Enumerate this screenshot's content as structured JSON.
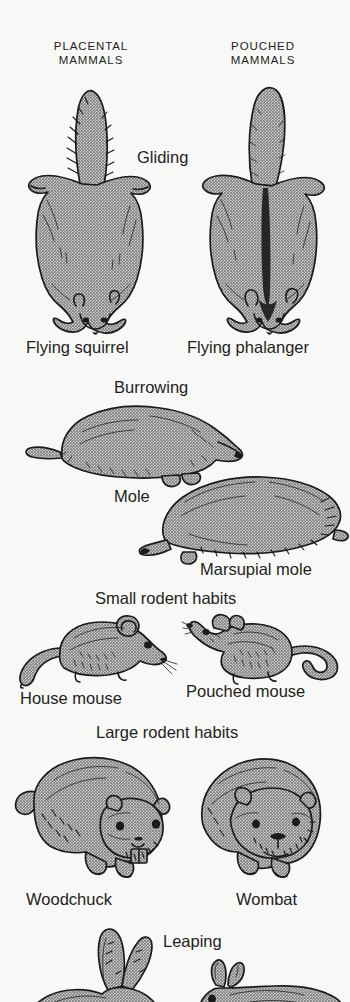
{
  "figure": {
    "title_visible": false,
    "background_color": "#f8f8f7",
    "fill_color": "#a8a8a8",
    "ink_color": "#1b1b1b",
    "columns": [
      {
        "id": "placental",
        "label_line1": "PLACENTAL",
        "label_line2": "MAMMALS"
      },
      {
        "id": "pouched",
        "label_line1": "POUCHED",
        "label_line2": "MAMMALS"
      }
    ],
    "habit_rows": [
      {
        "habit": "Gliding",
        "placental_species": "Flying squirrel",
        "pouched_species": "Flying phalanger"
      },
      {
        "habit": "Burrowing",
        "placental_species": "Mole",
        "pouched_species": "Marsupial mole"
      },
      {
        "habit": "Small rodent habits",
        "placental_species": "House mouse",
        "pouched_species": "Pouched mouse"
      },
      {
        "habit": "Large rodent habits",
        "placental_species": "Woodchuck",
        "pouched_species": "Wombat"
      },
      {
        "habit": "Leaping",
        "placental_species": "",
        "pouched_species": ""
      }
    ]
  },
  "labels": {
    "col_placental_1": "PLACENTAL",
    "col_placental_2": "MAMMALS",
    "col_pouched_1": "POUCHED",
    "col_pouched_2": "MAMMALS",
    "gliding": "Gliding",
    "flying_squirrel": "Flying squirrel",
    "flying_phalanger": "Flying phalanger",
    "burrowing": "Burrowing",
    "mole": "Mole",
    "marsupial_mole": "Marsupial mole",
    "small_rodent_habits": "Small rodent habits",
    "house_mouse": "House mouse",
    "pouched_mouse": "Pouched mouse",
    "large_rodent_habits": "Large rodent habits",
    "woodchuck": "Woodchuck",
    "wombat": "Wombat",
    "leaping": "Leaping"
  }
}
